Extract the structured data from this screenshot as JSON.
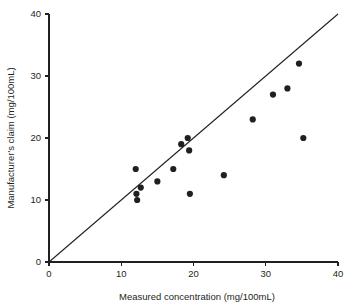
{
  "chart_data": {
    "type": "scatter",
    "title": "",
    "xlabel": "Measured concentration (mg/100mL)",
    "ylabel": "Manufacturer's claim (mg/100mL)",
    "xlim": [
      0,
      40
    ],
    "ylim": [
      0,
      40
    ],
    "xticks": [
      0,
      10,
      20,
      30,
      40
    ],
    "yticks": [
      0,
      10,
      20,
      30,
      40
    ],
    "xticklabels": [
      "0",
      "10",
      "20",
      "30",
      "40"
    ],
    "yticklabels": [
      "0",
      "10",
      "20",
      "30",
      "40"
    ],
    "grid": false,
    "legend": null,
    "marker": "filled-circle",
    "marker_color": "#231f20",
    "points": [
      {
        "x": 12.0,
        "y": 15.0
      },
      {
        "x": 12.7,
        "y": 12.0
      },
      {
        "x": 12.1,
        "y": 11.0
      },
      {
        "x": 12.2,
        "y": 10.0
      },
      {
        "x": 15.0,
        "y": 13.0
      },
      {
        "x": 17.2,
        "y": 15.0
      },
      {
        "x": 18.3,
        "y": 19.0
      },
      {
        "x": 19.2,
        "y": 20.0
      },
      {
        "x": 19.4,
        "y": 18.0
      },
      {
        "x": 19.5,
        "y": 11.0
      },
      {
        "x": 24.2,
        "y": 14.0
      },
      {
        "x": 28.2,
        "y": 23.0
      },
      {
        "x": 31.0,
        "y": 27.0
      },
      {
        "x": 33.0,
        "y": 28.0
      },
      {
        "x": 34.6,
        "y": 32.0
      },
      {
        "x": 35.2,
        "y": 20.0
      }
    ],
    "reference_line": {
      "name": "identity-line",
      "from": {
        "x": 0,
        "y": 0
      },
      "to": {
        "x": 40,
        "y": 40
      }
    }
  }
}
